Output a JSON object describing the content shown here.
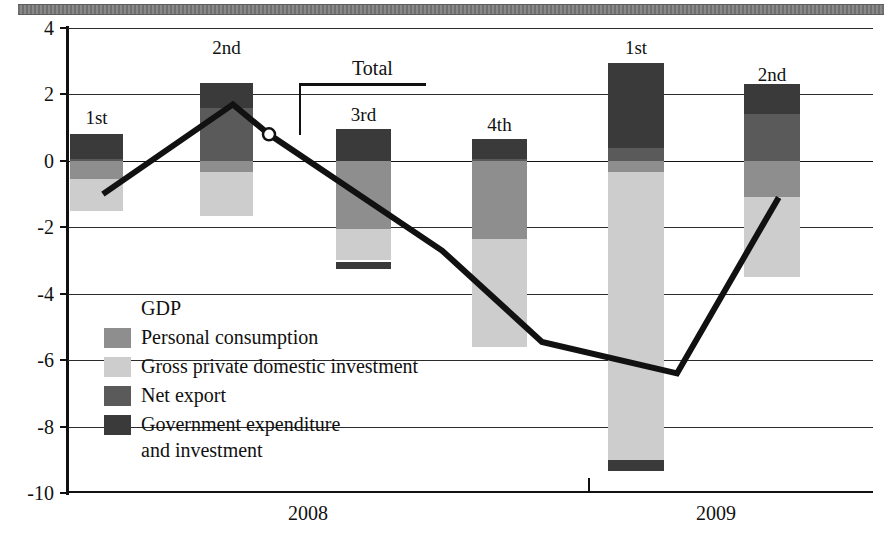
{
  "chart_data": {
    "type": "bar",
    "title": "",
    "subtitle": "",
    "xlabel": "",
    "ylabel": "",
    "ylim": [
      -10,
      4
    ],
    "ytick_labels": [
      "4",
      "2",
      "0",
      "-2",
      "-4",
      "-6",
      "-8",
      "-10"
    ],
    "ytick_values": [
      4,
      2,
      0,
      -2,
      -4,
      -6,
      -8,
      -10
    ],
    "grid": true,
    "stacked": true,
    "legend_position": "inside-lower-left",
    "categories": [
      "1st",
      "2nd",
      "3rd",
      "4th",
      "1st",
      "2nd"
    ],
    "group_labels": [
      "2008",
      "2009"
    ],
    "group_spans": [
      4,
      2
    ],
    "series": [
      {
        "name": "Personal consumption",
        "color": "#8e8e8e",
        "values": [
          -0.55,
          -0.35,
          -2.05,
          -2.35,
          -0.35,
          -1.1
        ]
      },
      {
        "name": "Gross private domestic investment",
        "color": "#cdcdcd",
        "values": [
          -0.95,
          -1.3,
          -0.95,
          -3.25,
          -8.95,
          -2.4
        ]
      },
      {
        "name": "Net export",
        "color": "#5a5a5a",
        "values": [
          0.05,
          1.6,
          0.0,
          0.05,
          0.4,
          1.4
        ]
      },
      {
        "name": "Government expenditure and investment",
        "color": "#3a3a3a",
        "values": [
          0.75,
          0.75,
          0.95,
          0.6,
          2.55,
          0.9
        ]
      }
    ],
    "total_line": {
      "name": "Total",
      "color": "#111111",
      "values": [
        -1.0,
        1.7,
        0.8,
        -2.7,
        -5.45,
        -6.4,
        -1.1
      ],
      "marker_index": 2,
      "annotation_label": "Total"
    }
  },
  "legend": {
    "title": "GDP",
    "items": [
      {
        "label": "Personal consumption",
        "color": "#8e8e8e"
      },
      {
        "label": "Gross private domestic investment",
        "color": "#cdcdcd"
      },
      {
        "label": "Net export",
        "color": "#5a5a5a"
      },
      {
        "label": "Government expenditure",
        "label2": "and investment",
        "color": "#3a3a3a"
      }
    ]
  },
  "axis": {
    "y_ticks": [
      "4",
      "2",
      "0",
      "-2",
      "-4",
      "-6",
      "-8",
      "-10"
    ],
    "x_groups": [
      "2008",
      "2009"
    ]
  },
  "bars": [
    {
      "label": "1st"
    },
    {
      "label": "2nd"
    },
    {
      "label": "3rd"
    },
    {
      "label": "4th"
    },
    {
      "label": "1st"
    },
    {
      "label": "2nd"
    }
  ],
  "annotations": {
    "total": "Total"
  }
}
